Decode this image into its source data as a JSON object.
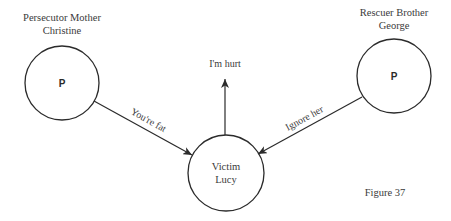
{
  "figure": {
    "caption": "Figure 37",
    "colors": {
      "line": "#2b2b2b",
      "text": "#3a3a3a",
      "background": "#ffffff"
    }
  },
  "nodes": {
    "mother": {
      "role": "Persecutor Mother",
      "name": "Christine",
      "symbol": "P"
    },
    "brother": {
      "role": "Rescuer Brother",
      "name": "George",
      "symbol": "P"
    },
    "victim": {
      "role": "Victim",
      "name": "Lucy"
    }
  },
  "edges": {
    "mother_to_victim": {
      "label": "You're fat"
    },
    "brother_to_victim": {
      "label": "Ignore her"
    },
    "victim_out": {
      "label": "I'm hurt"
    }
  }
}
